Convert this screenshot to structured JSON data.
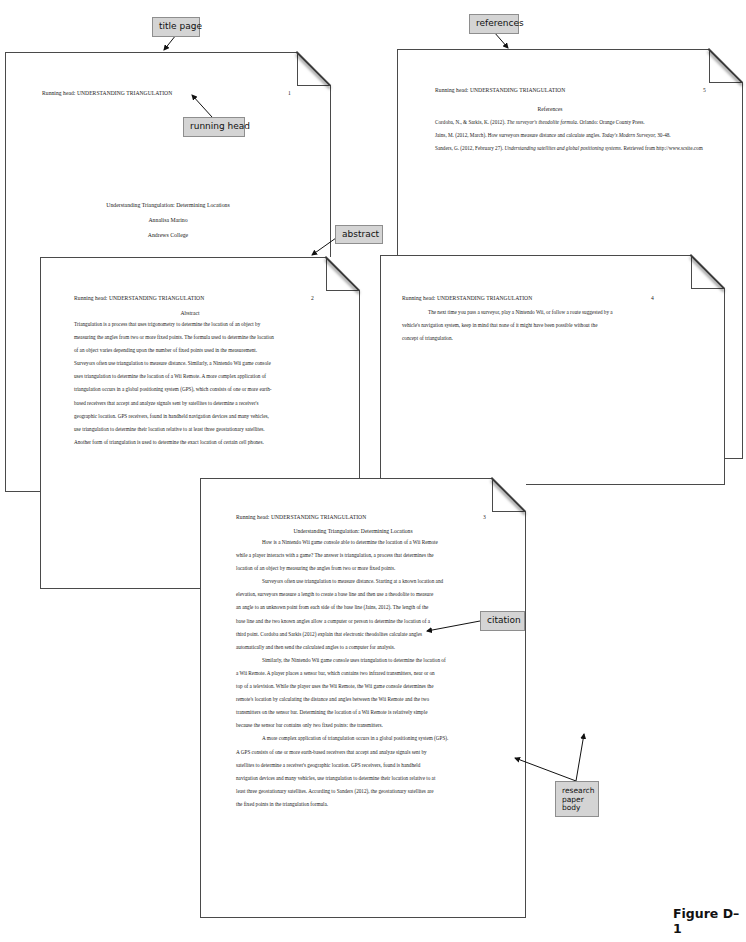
{
  "header_note": "Appendix D: APA style research paper sample",
  "running_head": "Running head: UNDERSTANDING TRIANGULATION",
  "callouts": {
    "title_page": "title page",
    "running_head": "running head",
    "references": "references",
    "abstract": "abstract",
    "citation": "citation",
    "research_paper_body": "research paper body"
  },
  "pages": {
    "title": {
      "page_number": "1",
      "title": "Understanding Triangulation: Determining Locations",
      "author": "Annalisa Marino",
      "institution": "Andrews College"
    },
    "abstract": {
      "page_number": "2",
      "heading": "Abstract",
      "lines": [
        "Triangulation is a process that uses trigonometry to determine the location of an object by",
        "measuring the angles from two or more fixed points. The formula used to determine the location",
        "of an object varies depending upon the number of fixed points used in the measurement.",
        "Surveyors often use triangulation to measure distance. Similarly, a Nintendo Wii game console",
        "uses triangulation to determine the location of a Wii Remote. A more complex application of",
        "triangulation occurs in a global positioning system (GPS), which consists of one or more earth-",
        "based receivers that accept and analyze signals sent by satellites to determine a receiver's",
        "geographic location. GPS receivers, found in handheld navigation devices and many vehicles,",
        "use triangulation to determine their location relative to at least three geostationary satellites.",
        "Another form of triangulation is used to determine the exact location of certain cell phones."
      ]
    },
    "body": {
      "page_number": "3",
      "heading": "Understanding Triangulation: Determining Locations",
      "lines": [
        {
          "text": "How is a Nintendo Wii game console able to determine the location of a Wii Remote",
          "indent": true
        },
        {
          "text": "while a player interacts with a game? The answer is triangulation, a process that determines the",
          "indent": false
        },
        {
          "text": "location of an object by measuring the angles from two or more fixed points.",
          "indent": false
        },
        {
          "text": "Surveyors often use triangulation to measure distance. Starting at a known location and",
          "indent": true
        },
        {
          "text": "elevation, surveyors measure a length to create a base line and then use a theodolite to measure",
          "indent": false
        },
        {
          "text": "an angle to an unknown point from each side of the base line (Jains, 2012). The length of the",
          "indent": false
        },
        {
          "text": "base line and the two known angles allow a computer or person to determine the location of a",
          "indent": false
        },
        {
          "text": "third point. Cordoba and Sarkis (2012) explain that electronic theodolites calculate angles",
          "indent": false
        },
        {
          "text": "automatically and then send the calculated angles to a computer for analysis.",
          "indent": false
        },
        {
          "text": "Similarly, the Nintendo Wii game console uses triangulation to determine the location of",
          "indent": true
        },
        {
          "text": "a Wii Remote. A player places a sensor bar, which contains two infrared transmitters, near or on",
          "indent": false
        },
        {
          "text": "top of a television. While the player uses the Wii Remote, the Wii game console determines the",
          "indent": false
        },
        {
          "text": "remote's location by calculating the distance and angles between the Wii Remote and the two",
          "indent": false
        },
        {
          "text": "transmitters on the sensor bar. Determining the location of a Wii Remote is relatively simple",
          "indent": false
        },
        {
          "text": "because the sensor bar contains only two fixed points: the transmitters.",
          "indent": false
        },
        {
          "text": "A more complex application of triangulation occurs in a global positioning system (GPS).",
          "indent": true
        },
        {
          "text": "A GPS consists of one or more earth-based receivers that accept and analyze signals sent by",
          "indent": false
        },
        {
          "text": "satellites to determine a receiver's geographic location. GPS receivers, found is handheld",
          "indent": false
        },
        {
          "text": "navigation devices and many vehicles, use triangulation to determine their location relative to at",
          "indent": false
        },
        {
          "text": "least three geostationary satellites. According to Sanders (2012), the geostationary satellites are",
          "indent": false
        },
        {
          "text": "the fixed points in the triangulation formula.",
          "indent": false
        }
      ]
    },
    "conclusion": {
      "page_number": "4",
      "lines": [
        {
          "text": "The next time you pass a surveyor, play a Nintendo Wii, or follow a route suggested by a",
          "indent": true
        },
        {
          "text": "vehicle's navigation system, keep in mind that none of it might have been possible without the",
          "indent": false
        },
        {
          "text": "concept of triangulation.",
          "indent": false
        }
      ]
    },
    "references": {
      "page_number": "5",
      "heading": "References",
      "entries": [
        {
          "pre": "Cordoba, N., & Sarkis, K. (2012). ",
          "italic": "The surveyor's theodolite formula.",
          "post": " Orlando: Orange County Press."
        },
        {
          "pre": "Jains, M. (2012, March). How surveyors measure distance and calculate angles. ",
          "italic": "Today's Modern Surveyor,",
          "post": " 30-48."
        },
        {
          "pre": "Sanders, G. (2012, February 27). ",
          "italic": "Understanding satellites and global positioning systems.",
          "post": " Retrieved from http://www.scsite.com"
        }
      ]
    }
  },
  "figure_label": "Figure D–1",
  "colors": {
    "callout_fill": "#d4d4d4",
    "callout_border": "#8e8e8e",
    "page_border": "#4a4a4a",
    "text": "#222222"
  }
}
